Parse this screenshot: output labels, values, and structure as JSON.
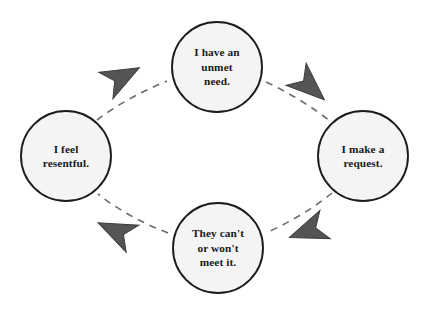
{
  "diagram": {
    "type": "cycle-diagram",
    "direction": "clockwise",
    "colors": {
      "background": "#ffffff",
      "node_fill": "#f4f4f4",
      "node_stroke": "#1c1c1c",
      "text": "#1a1a1a",
      "connector": "#6b6b6b",
      "arrowhead_fill": "#555555",
      "arrowhead_stroke": "#3d3d3d"
    },
    "nodes": [
      {
        "id": "need",
        "label": "I have an\nunmet\nneed.",
        "position": "top",
        "cx": 217,
        "cy": 67,
        "r": 45
      },
      {
        "id": "request",
        "label": "I make a\nrequest.",
        "position": "right",
        "cx": 363,
        "cy": 156,
        "r": 45
      },
      {
        "id": "meet",
        "label": "They can't\nor won't\nmeet it.",
        "position": "bottom",
        "cx": 218,
        "cy": 248,
        "r": 45
      },
      {
        "id": "resentful",
        "label": "I feel\nresentful.",
        "position": "left",
        "cx": 66,
        "cy": 156,
        "r": 45
      }
    ],
    "connectors": [
      {
        "id": "need-to-request",
        "from": "need",
        "to": "request",
        "style": "dashed",
        "arrow": "down-right"
      },
      {
        "id": "request-to-meet",
        "from": "request",
        "to": "meet",
        "style": "dashed",
        "arrow": "down-left"
      },
      {
        "id": "meet-to-resentful",
        "from": "meet",
        "to": "resentful",
        "style": "dashed",
        "arrow": "up-left"
      },
      {
        "id": "resentful-to-need",
        "from": "resentful",
        "to": "need",
        "style": "dashed",
        "arrow": "up-right"
      }
    ]
  }
}
